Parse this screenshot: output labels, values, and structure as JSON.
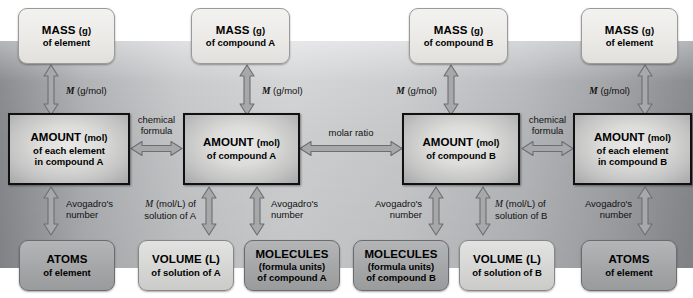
{
  "diagram": {
    "colors": {
      "panel_left": "#8e9094",
      "panel_center": "#dadbdd",
      "panel_right": "#8d8f93",
      "mass_box": "#eceae7",
      "mid_gray_box": "#a5a6a8",
      "lite_gray_box": "#d6d6d4",
      "amount_border": "#111111",
      "arrow_fill": "#a7a8aa",
      "arrow_stroke": "#6d6e70",
      "text": "#000000"
    }
  },
  "mass_row": [
    {
      "line1": "MASS",
      "unit": "(g)",
      "line2": "of element"
    },
    {
      "line1": "MASS",
      "unit": "(g)",
      "line2": "of compound A"
    },
    {
      "line1": "MASS",
      "unit": "(g)",
      "line2": "of compound B"
    },
    {
      "line1": "MASS",
      "unit": "(g)",
      "line2": "of element"
    }
  ],
  "amount_row": [
    {
      "line1": "AMOUNT",
      "unit": "(mol)",
      "line2": "of each element",
      "line3": "in compound A"
    },
    {
      "line1": "AMOUNT",
      "unit": "(mol)",
      "line2": "of compound A",
      "line3": ""
    },
    {
      "line1": "AMOUNT",
      "unit": "(mol)",
      "line2": "of compound B",
      "line3": ""
    },
    {
      "line1": "AMOUNT",
      "unit": "(mol)",
      "line2": "of each element",
      "line3": "in compound B"
    }
  ],
  "bottom_row": [
    {
      "line1": "ATOMS",
      "line2": "of element",
      "line3": ""
    },
    {
      "line1": "VOLUME (L)",
      "line2": "of solution of A",
      "line3": ""
    },
    {
      "line1": "MOLECULES",
      "line2": "(formula units)",
      "line3": "of compound A"
    },
    {
      "line1": "MOLECULES",
      "line2": "(formula units)",
      "line3": "of compound B"
    },
    {
      "line1": "VOLUME (L)",
      "line2": "of solution of B",
      "line3": ""
    },
    {
      "line1": "ATOMS",
      "line2": "of element",
      "line3": ""
    }
  ],
  "labels": {
    "molar_mass_1": "(g/mol)",
    "molar_mass_2": "(g/mol)",
    "molar_mass_3": "(g/mol)",
    "molar_mass_4": "(g/mol)",
    "molar_mass_symbol": "M",
    "molarity_symbol": "M",
    "molarity_units": "(mol/L) of",
    "solution_of_a": "solution of A",
    "solution_of_b": "solution of B",
    "avogadro_line1": "Avogadro's",
    "avogadro_line2": "number",
    "chemical_formula_line1": "chemical",
    "chemical_formula_line2": "formula",
    "molar_ratio": "molar ratio"
  }
}
